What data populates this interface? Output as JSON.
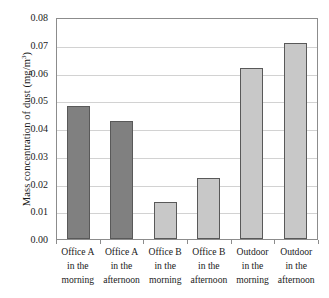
{
  "chart_data": {
    "type": "bar",
    "title": "",
    "subtitle": "",
    "xlabel": "",
    "ylabel": "Mass concentration of dust (mg/m³)",
    "ylabel_parts": {
      "main": "Mass concentration of dust (mg/m",
      "superscript": "3",
      "tail": ")"
    },
    "categories": [
      "Office A in the morning",
      "Office A in the afternoon",
      "Office B in the morning",
      "Office B in the afternoon",
      "Outdoor in the morning",
      "Outdoor in the afternoon"
    ],
    "category_lines": [
      [
        "Office A",
        "in the",
        "morning"
      ],
      [
        "Office A",
        "in the",
        "afternoon"
      ],
      [
        "Office B",
        "in the",
        "morning"
      ],
      [
        "Office B",
        "in the",
        "afternoon"
      ],
      [
        "Outdoor",
        "in the",
        "morning"
      ],
      [
        "Outdoor",
        "in the",
        "afternoon"
      ]
    ],
    "values": [
      0.048,
      0.0425,
      0.0135,
      0.022,
      0.0615,
      0.0705
    ],
    "bar_colors": [
      "#808080",
      "#808080",
      "#c8c8c8",
      "#c8c8c8",
      "#c8c8c8",
      "#c8c8c8"
    ],
    "bar_border_color": "#595959",
    "ylim": [
      0.0,
      0.08
    ],
    "ytick_values": [
      0.08,
      0.07,
      0.06,
      0.05,
      0.04,
      0.03,
      0.02,
      0.01,
      0.0
    ],
    "ytick_labels": [
      "0.08",
      "0.07",
      "0.06",
      "0.05",
      "0.04",
      "0.03",
      "0.02",
      "0.01",
      "0.00"
    ],
    "grid": true,
    "grid_color": "#d2d2d2",
    "legend": null,
    "legend_position": "none",
    "plot_border_color": "#8c8c8c",
    "background": "#ffffff"
  }
}
